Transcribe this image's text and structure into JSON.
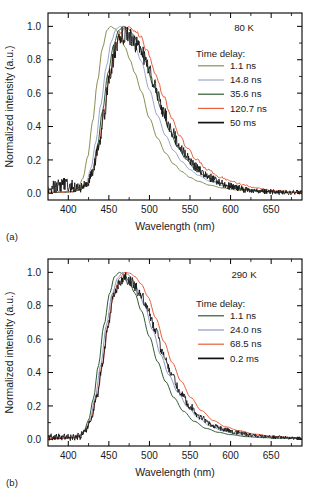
{
  "figure": {
    "panels": [
      {
        "id": "a",
        "panel_label": "(a)",
        "temperature": "80 K",
        "legend_title": "Time delay:",
        "xlabel": "Wavelength (nm)",
        "ylabel": "Normalized intensity (a.u.)"
      },
      {
        "id": "b",
        "panel_label": "(b)",
        "temperature": "290 K",
        "legend_title": "Time delay:",
        "xlabel": "Wavelength (nm)",
        "ylabel": "Normalized intensity (a.u.)"
      }
    ]
  },
  "chart_data": [
    {
      "type": "line",
      "title": "80 K",
      "panel": "(a)",
      "xlabel": "Wavelength (nm)",
      "ylabel": "Normalized intensity (a.u.)",
      "xlim": [
        375,
        688
      ],
      "ylim": [
        -0.04,
        1.08
      ],
      "xticks": [
        400,
        450,
        500,
        550,
        600,
        650
      ],
      "xticklabels": [
        "400",
        "450",
        "500",
        "550",
        "600",
        "650"
      ],
      "yticks": [
        0.0,
        0.2,
        0.4,
        0.6,
        0.8,
        1.0
      ],
      "yticklabels": [
        "0.0",
        "0.2",
        "0.4",
        "0.6",
        "0.8",
        "1.0"
      ],
      "grid": false,
      "legend_position": "upper-right",
      "legend_title": "Time delay:",
      "series": [
        {
          "name": "1.1 ns",
          "color": "#8a8f52",
          "noise": 0.0,
          "peak": 452,
          "width_left": 20,
          "width_right": 42,
          "tail": 0.055,
          "x": [
            375,
            385,
            395,
            405,
            412,
            418,
            424,
            430,
            436,
            442,
            448,
            452,
            458,
            464,
            470,
            476,
            482,
            490,
            500,
            510,
            520,
            530,
            540,
            550,
            560,
            575,
            590,
            610,
            630,
            650,
            670,
            688
          ],
          "y": [
            0.005,
            0.006,
            0.008,
            0.012,
            0.03,
            0.09,
            0.22,
            0.43,
            0.67,
            0.87,
            0.98,
            1.0,
            0.985,
            0.94,
            0.875,
            0.8,
            0.72,
            0.61,
            0.45,
            0.33,
            0.24,
            0.175,
            0.13,
            0.095,
            0.072,
            0.048,
            0.032,
            0.019,
            0.012,
            0.008,
            0.005,
            0.004
          ]
        },
        {
          "name": "14.8 ns",
          "color": "#9aa7cc",
          "noise": 0.0,
          "peak": 462,
          "width_left": 21,
          "width_right": 45,
          "tail": 0.06,
          "x": [
            375,
            385,
            395,
            405,
            415,
            422,
            428,
            434,
            440,
            447,
            453,
            459,
            464,
            470,
            476,
            482,
            490,
            500,
            510,
            520,
            530,
            540,
            550,
            560,
            575,
            590,
            610,
            630,
            650,
            670,
            688
          ],
          "y": [
            0.004,
            0.005,
            0.007,
            0.01,
            0.022,
            0.06,
            0.15,
            0.31,
            0.53,
            0.76,
            0.91,
            0.985,
            1.0,
            0.985,
            0.945,
            0.885,
            0.79,
            0.62,
            0.465,
            0.345,
            0.255,
            0.19,
            0.142,
            0.108,
            0.072,
            0.048,
            0.027,
            0.016,
            0.009,
            0.006,
            0.004
          ]
        },
        {
          "name": "35.6 ns",
          "color": "#2f5b34",
          "noise": 0.0,
          "peak": 466,
          "width_left": 22,
          "width_right": 46,
          "tail": 0.06,
          "x": [
            375,
            385,
            395,
            405,
            415,
            423,
            430,
            436,
            442,
            449,
            456,
            462,
            468,
            474,
            480,
            487,
            495,
            505,
            515,
            525,
            535,
            545,
            555,
            570,
            585,
            600,
            620,
            640,
            660,
            688
          ],
          "y": [
            0.004,
            0.005,
            0.007,
            0.01,
            0.02,
            0.055,
            0.14,
            0.285,
            0.49,
            0.72,
            0.89,
            0.975,
            1.0,
            0.985,
            0.95,
            0.89,
            0.79,
            0.645,
            0.5,
            0.375,
            0.275,
            0.205,
            0.152,
            0.098,
            0.064,
            0.042,
            0.023,
            0.013,
            0.008,
            0.005
          ]
        },
        {
          "name": "120.7 ns",
          "color": "#e8603c",
          "noise": 0.012,
          "peak": 470,
          "width_left": 23,
          "width_right": 52,
          "tail": 0.09,
          "x": [
            375,
            385,
            395,
            405,
            415,
            423,
            430,
            437,
            444,
            451,
            458,
            464,
            470,
            476,
            482,
            489,
            497,
            507,
            517,
            527,
            537,
            547,
            557,
            572,
            587,
            602,
            617,
            632,
            650,
            670,
            688
          ],
          "y": [
            0.008,
            0.009,
            0.011,
            0.014,
            0.024,
            0.055,
            0.135,
            0.275,
            0.475,
            0.7,
            0.875,
            0.965,
            1.0,
            0.995,
            0.975,
            0.935,
            0.855,
            0.725,
            0.585,
            0.455,
            0.35,
            0.268,
            0.205,
            0.14,
            0.098,
            0.068,
            0.048,
            0.032,
            0.018,
            0.01,
            0.006
          ]
        },
        {
          "name": "50 ms",
          "color": "#101010",
          "noise": 0.055,
          "peak": 470,
          "width_left": 23,
          "width_right": 46,
          "tail": 0.06,
          "x": [
            375,
            385,
            395,
            405,
            415,
            423,
            430,
            437,
            444,
            451,
            458,
            464,
            470,
            476,
            482,
            489,
            497,
            507,
            517,
            527,
            537,
            547,
            557,
            572,
            587,
            602,
            620,
            640,
            660,
            688
          ],
          "y": [
            0.02,
            0.045,
            0.05,
            0.04,
            0.03,
            0.05,
            0.13,
            0.27,
            0.47,
            0.695,
            0.86,
            0.93,
            0.955,
            0.935,
            0.9,
            0.855,
            0.77,
            0.635,
            0.495,
            0.375,
            0.285,
            0.21,
            0.155,
            0.098,
            0.062,
            0.04,
            0.022,
            0.012,
            0.008,
            0.005
          ]
        }
      ]
    },
    {
      "type": "line",
      "title": "290 K",
      "panel": "(b)",
      "xlabel": "Wavelength (nm)",
      "ylabel": "Normalized intensity (a.u.)",
      "xlim": [
        375,
        688
      ],
      "ylim": [
        -0.04,
        1.08
      ],
      "xticks": [
        400,
        450,
        500,
        550,
        600,
        650
      ],
      "xticklabels": [
        "400",
        "450",
        "500",
        "550",
        "600",
        "650"
      ],
      "yticks": [
        0.0,
        0.2,
        0.4,
        0.6,
        0.8,
        1.0
      ],
      "yticklabels": [
        "0.0",
        "0.2",
        "0.4",
        "0.6",
        "0.8",
        "1.0"
      ],
      "grid": false,
      "legend_position": "upper-right",
      "legend_title": "Time delay:",
      "series": [
        {
          "name": "1.1 ns",
          "color": "#2f5b34",
          "noise": 0.0,
          "peak": 464,
          "width_left": 21,
          "width_right": 43,
          "tail": 0.05,
          "x": [
            375,
            385,
            395,
            405,
            413,
            419,
            425,
            431,
            437,
            444,
            451,
            457,
            463,
            469,
            475,
            482,
            490,
            500,
            510,
            520,
            530,
            542,
            555,
            570,
            585,
            600,
            620,
            640,
            660,
            688
          ],
          "y": [
            0.004,
            0.005,
            0.006,
            0.009,
            0.018,
            0.045,
            0.115,
            0.245,
            0.44,
            0.685,
            0.875,
            0.975,
            1.0,
            0.985,
            0.945,
            0.875,
            0.77,
            0.615,
            0.465,
            0.345,
            0.25,
            0.168,
            0.108,
            0.065,
            0.042,
            0.028,
            0.016,
            0.01,
            0.007,
            0.005
          ]
        },
        {
          "name": "24.0 ns",
          "color": "#9098c4",
          "noise": 0.0,
          "peak": 468,
          "width_left": 22,
          "width_right": 45,
          "tail": 0.055,
          "x": [
            375,
            385,
            395,
            405,
            415,
            421,
            427,
            433,
            440,
            447,
            454,
            461,
            467,
            473,
            479,
            486,
            494,
            504,
            514,
            524,
            535,
            547,
            560,
            575,
            590,
            605,
            625,
            645,
            665,
            688
          ],
          "y": [
            0.004,
            0.005,
            0.006,
            0.009,
            0.02,
            0.05,
            0.12,
            0.245,
            0.445,
            0.685,
            0.87,
            0.968,
            1.0,
            0.99,
            0.955,
            0.895,
            0.8,
            0.655,
            0.505,
            0.385,
            0.282,
            0.195,
            0.13,
            0.08,
            0.052,
            0.035,
            0.02,
            0.012,
            0.008,
            0.005
          ]
        },
        {
          "name": "68.5 ns",
          "color": "#e8603c",
          "noise": 0.0,
          "peak": 470,
          "width_left": 22,
          "width_right": 48,
          "tail": 0.07,
          "x": [
            375,
            385,
            395,
            405,
            415,
            421,
            428,
            435,
            442,
            449,
            456,
            463,
            470,
            476,
            482,
            490,
            498,
            508,
            518,
            528,
            539,
            551,
            564,
            579,
            594,
            610,
            630,
            650,
            670,
            688
          ],
          "y": [
            0.005,
            0.006,
            0.007,
            0.01,
            0.022,
            0.05,
            0.12,
            0.25,
            0.45,
            0.685,
            0.865,
            0.965,
            1.0,
            0.995,
            0.975,
            0.93,
            0.855,
            0.725,
            0.585,
            0.46,
            0.348,
            0.25,
            0.172,
            0.112,
            0.075,
            0.052,
            0.031,
            0.019,
            0.012,
            0.008
          ]
        },
        {
          "name": "0.2 ms",
          "color": "#101010",
          "noise": 0.035,
          "peak": 468,
          "width_left": 22,
          "width_right": 44,
          "tail": 0.055,
          "x": [
            375,
            385,
            395,
            405,
            415,
            421,
            428,
            435,
            442,
            449,
            456,
            463,
            469,
            475,
            481,
            489,
            497,
            507,
            517,
            527,
            538,
            550,
            563,
            578,
            593,
            609,
            629,
            649,
            669,
            688
          ],
          "y": [
            0.012,
            0.018,
            0.015,
            0.012,
            0.02,
            0.048,
            0.12,
            0.25,
            0.45,
            0.68,
            0.855,
            0.945,
            0.97,
            0.955,
            0.925,
            0.875,
            0.79,
            0.655,
            0.51,
            0.39,
            0.285,
            0.197,
            0.132,
            0.082,
            0.055,
            0.038,
            0.022,
            0.014,
            0.009,
            0.006
          ]
        }
      ]
    }
  ]
}
